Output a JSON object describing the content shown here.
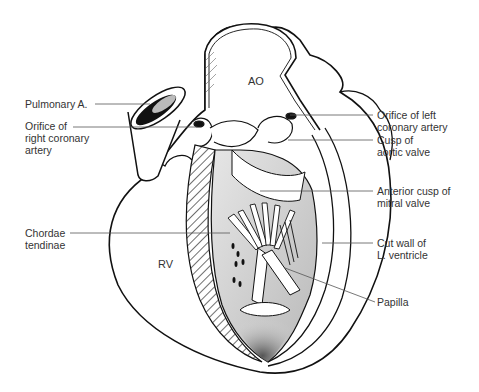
{
  "diagram": {
    "region_labels": {
      "aorta": "AO",
      "right_ventricle": "RV"
    },
    "labels_left": [
      {
        "id": "pulmonary-a",
        "lines": [
          "Pulmonary A."
        ]
      },
      {
        "id": "orifice-right-coronary",
        "lines": [
          "Orifice of",
          "right coronary",
          "artery"
        ]
      },
      {
        "id": "chordae-tendinae",
        "lines": [
          "Chordae",
          "tendinae"
        ]
      }
    ],
    "labels_right": [
      {
        "id": "orifice-left-coronary",
        "lines": [
          "Orifice of left",
          "coronary artery"
        ]
      },
      {
        "id": "cusp-aortic-valve",
        "lines": [
          "Cusp of",
          "aortic valve"
        ]
      },
      {
        "id": "anterior-cusp-mitral",
        "lines": [
          "Anterior cusp of",
          "mitral valve"
        ]
      },
      {
        "id": "cut-wall-lv",
        "lines": [
          "Cut wall of",
          "L. ventricle"
        ]
      },
      {
        "id": "papilla",
        "lines": [
          "Papilla"
        ]
      }
    ],
    "colors": {
      "line": "#111111",
      "leader": "#555555",
      "shade": "#c8c8c8",
      "text": "#333333"
    }
  }
}
